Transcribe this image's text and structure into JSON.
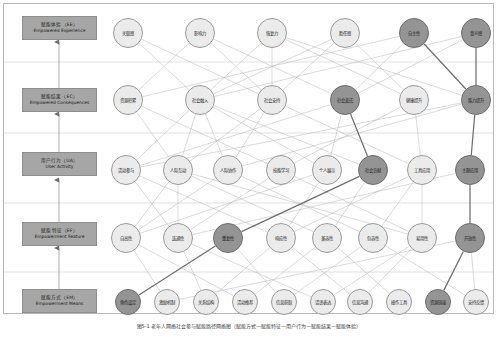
{
  "figure": {
    "caption": "图5-1 老年人网络社会参与赋能路径网络图（赋能方式—赋能特征—用户行为—赋能结果—赋能体验）",
    "width": 498,
    "height": 337,
    "colors": {
      "node_fill": "#ebebeb",
      "node_stroke": "#9a9a9a",
      "node_highlight_fill": "#949494",
      "node_highlight_stroke": "#6d6d6d",
      "layer_box_fill": "#a6a6a6",
      "edge": "#b5b5b5",
      "edge_highlight": "#6f6f6f",
      "frame": "#b9b9b9"
    }
  },
  "layers": [
    {
      "id": "EE",
      "cn": "赋能体验（EE）",
      "en": "Empowered Experience",
      "box": {
        "x": 22,
        "y": 16,
        "w": 75,
        "h": 24
      },
      "row_y": 33,
      "divider_y": 62,
      "nodes": [
        {
          "label": "关联感",
          "cx": 128,
          "cy": 33,
          "r": 15,
          "highlight": false
        },
        {
          "label": "影响力",
          "cx": 200,
          "cy": 33,
          "r": 15,
          "highlight": false
        },
        {
          "label": "恢复力",
          "cx": 272,
          "cy": 33,
          "r": 15,
          "highlight": false
        },
        {
          "label": "胜任感",
          "cx": 345,
          "cy": 33,
          "r": 15,
          "highlight": false
        },
        {
          "label": "自主性",
          "cx": 414,
          "cy": 33,
          "r": 15,
          "highlight": true
        },
        {
          "label": "意义感",
          "cx": 476,
          "cy": 33,
          "r": 15,
          "highlight": true
        }
      ]
    },
    {
      "id": "EC",
      "cn": "赋能结果（EC）",
      "en": "Empowered Consequences",
      "box": {
        "x": 22,
        "y": 88,
        "w": 75,
        "h": 24
      },
      "row_y": 100,
      "divider_y": 133,
      "nodes": [
        {
          "label": "资源积累",
          "cx": 128,
          "cy": 100,
          "r": 15,
          "highlight": false
        },
        {
          "label": "社会融入",
          "cx": 200,
          "cy": 100,
          "r": 15,
          "highlight": false
        },
        {
          "label": "社会支持",
          "cx": 272,
          "cy": 100,
          "r": 15,
          "highlight": false
        },
        {
          "label": "社会变迁",
          "cx": 345,
          "cy": 100,
          "r": 15,
          "highlight": true
        },
        {
          "label": "健康提升",
          "cx": 414,
          "cy": 100,
          "r": 15,
          "highlight": false
        },
        {
          "label": "能力提升",
          "cx": 476,
          "cy": 100,
          "r": 15,
          "highlight": true
        }
      ]
    },
    {
      "id": "UA",
      "cn": "用户行为（UA）",
      "en": "User Activity",
      "box": {
        "x": 22,
        "y": 152,
        "w": 75,
        "h": 24
      },
      "row_y": 170,
      "divider_y": 203,
      "nodes": [
        {
          "label": "活动参与",
          "cx": 126,
          "cy": 170,
          "r": 15,
          "highlight": false
        },
        {
          "label": "人际互动",
          "cx": 178,
          "cy": 170,
          "r": 15,
          "highlight": false
        },
        {
          "label": "人际协作",
          "cx": 228,
          "cy": 170,
          "r": 15,
          "highlight": false
        },
        {
          "label": "技能学习",
          "cx": 281,
          "cy": 170,
          "r": 15,
          "highlight": false
        },
        {
          "label": "个人展示",
          "cx": 327,
          "cy": 170,
          "r": 15,
          "highlight": false
        },
        {
          "label": "社会贡献",
          "cx": 373,
          "cy": 170,
          "r": 15,
          "highlight": true
        },
        {
          "label": "工具应用",
          "cx": 422,
          "cy": 170,
          "r": 15,
          "highlight": false
        },
        {
          "label": "主题应用",
          "cx": 470,
          "cy": 170,
          "r": 15,
          "highlight": true
        }
      ]
    },
    {
      "id": "EF",
      "cn": "赋能特征（EF）",
      "en": "Empowerment Feature",
      "box": {
        "x": 22,
        "y": 222,
        "w": 75,
        "h": 24
      },
      "row_y": 238,
      "divider_y": 272,
      "nodes": [
        {
          "label": "自高性",
          "cx": 126,
          "cy": 238,
          "r": 15,
          "highlight": false
        },
        {
          "label": "连通性",
          "cx": 178,
          "cy": 238,
          "r": 15,
          "highlight": false
        },
        {
          "label": "重复性",
          "cx": 228,
          "cy": 238,
          "r": 15,
          "highlight": true
        },
        {
          "label": "响应性",
          "cx": 281,
          "cy": 238,
          "r": 15,
          "highlight": false
        },
        {
          "label": "兼容性",
          "cx": 327,
          "cy": 238,
          "r": 15,
          "highlight": false
        },
        {
          "label": "包容性",
          "cx": 373,
          "cy": 238,
          "r": 15,
          "highlight": false
        },
        {
          "label": "易用性",
          "cx": 422,
          "cy": 238,
          "r": 15,
          "highlight": false
        },
        {
          "label": "开放性",
          "cx": 470,
          "cy": 238,
          "r": 15,
          "highlight": true
        }
      ]
    },
    {
      "id": "EM",
      "cn": "赋能方式（EM）",
      "en": "Empowerment Means",
      "box": {
        "x": 22,
        "y": 289,
        "w": 75,
        "h": 24
      },
      "row_y": 302,
      "divider_y": null,
      "nodes": [
        {
          "label": "角色设定",
          "cx": 128,
          "cy": 302,
          "r": 13,
          "highlight": true
        },
        {
          "label": "激励机制",
          "cx": 167,
          "cy": 302,
          "r": 13,
          "highlight": false
        },
        {
          "label": "关系结构",
          "cx": 206,
          "cy": 302,
          "r": 13,
          "highlight": false
        },
        {
          "label": "活动推荐",
          "cx": 245,
          "cy": 302,
          "r": 13,
          "highlight": false
        },
        {
          "label": "信息获取",
          "cx": 284,
          "cy": 302,
          "r": 13,
          "highlight": false
        },
        {
          "label": "话语表达",
          "cx": 323,
          "cy": 302,
          "r": 13,
          "highlight": false
        },
        {
          "label": "信息沟通",
          "cx": 360,
          "cy": 302,
          "r": 13,
          "highlight": false
        },
        {
          "label": "操作工具",
          "cx": 399,
          "cy": 302,
          "r": 13,
          "highlight": false
        },
        {
          "label": "资源链接",
          "cx": 438,
          "cy": 302,
          "r": 13,
          "highlight": true
        },
        {
          "label": "支持反馈",
          "cx": 476,
          "cy": 302,
          "r": 13,
          "highlight": false
        }
      ]
    }
  ],
  "layer_arrows": [
    {
      "from": "EM",
      "to": "EF",
      "x": 59,
      "y1": 289,
      "y2": 248
    },
    {
      "from": "EF",
      "to": "UA",
      "x": 59,
      "y1": 222,
      "y2": 180
    },
    {
      "from": "UA",
      "to": "EC",
      "x": 59,
      "y1": 152,
      "y2": 114
    },
    {
      "from": "EC",
      "to": "EE",
      "x": 59,
      "y1": 88,
      "y2": 42
    }
  ],
  "edges": [
    {
      "from": [
        128,
        33
      ],
      "to": [
        200,
        100
      ],
      "hi": false
    },
    {
      "from": [
        128,
        33
      ],
      "to": [
        272,
        100
      ],
      "hi": false
    },
    {
      "from": [
        200,
        33
      ],
      "to": [
        128,
        100
      ],
      "hi": false
    },
    {
      "from": [
        200,
        33
      ],
      "to": [
        272,
        100
      ],
      "hi": false
    },
    {
      "from": [
        200,
        33
      ],
      "to": [
        345,
        100
      ],
      "hi": false
    },
    {
      "from": [
        272,
        33
      ],
      "to": [
        200,
        100
      ],
      "hi": false
    },
    {
      "from": [
        272,
        33
      ],
      "to": [
        272,
        100
      ],
      "hi": false
    },
    {
      "from": [
        272,
        33
      ],
      "to": [
        414,
        100
      ],
      "hi": false
    },
    {
      "from": [
        272,
        33
      ],
      "to": [
        476,
        100
      ],
      "hi": false
    },
    {
      "from": [
        345,
        33
      ],
      "to": [
        200,
        100
      ],
      "hi": false
    },
    {
      "from": [
        345,
        33
      ],
      "to": [
        272,
        100
      ],
      "hi": false
    },
    {
      "from": [
        345,
        33
      ],
      "to": [
        414,
        100
      ],
      "hi": false
    },
    {
      "from": [
        414,
        33
      ],
      "to": [
        128,
        100
      ],
      "hi": false
    },
    {
      "from": [
        414,
        33
      ],
      "to": [
        345,
        100
      ],
      "hi": false
    },
    {
      "from": [
        414,
        33
      ],
      "to": [
        476,
        100
      ],
      "hi": true
    },
    {
      "from": [
        476,
        33
      ],
      "to": [
        200,
        100
      ],
      "hi": false
    },
    {
      "from": [
        476,
        33
      ],
      "to": [
        476,
        100
      ],
      "hi": true
    },
    {
      "from": [
        476,
        33
      ],
      "to": [
        345,
        100
      ],
      "hi": false
    },
    {
      "from": [
        128,
        100
      ],
      "to": [
        178,
        170
      ],
      "hi": false
    },
    {
      "from": [
        128,
        100
      ],
      "to": [
        281,
        170
      ],
      "hi": false
    },
    {
      "from": [
        200,
        100
      ],
      "to": [
        126,
        170
      ],
      "hi": false
    },
    {
      "from": [
        200,
        100
      ],
      "to": [
        178,
        170
      ],
      "hi": false
    },
    {
      "from": [
        200,
        100
      ],
      "to": [
        228,
        170
      ],
      "hi": false
    },
    {
      "from": [
        200,
        100
      ],
      "to": [
        327,
        170
      ],
      "hi": false
    },
    {
      "from": [
        200,
        100
      ],
      "to": [
        373,
        170
      ],
      "hi": false
    },
    {
      "from": [
        272,
        100
      ],
      "to": [
        178,
        170
      ],
      "hi": false
    },
    {
      "from": [
        272,
        100
      ],
      "to": [
        228,
        170
      ],
      "hi": false
    },
    {
      "from": [
        272,
        100
      ],
      "to": [
        422,
        170
      ],
      "hi": false
    },
    {
      "from": [
        345,
        100
      ],
      "to": [
        327,
        170
      ],
      "hi": false
    },
    {
      "from": [
        345,
        100
      ],
      "to": [
        373,
        170
      ],
      "hi": true
    },
    {
      "from": [
        345,
        100
      ],
      "to": [
        126,
        170
      ],
      "hi": false
    },
    {
      "from": [
        414,
        100
      ],
      "to": [
        281,
        170
      ],
      "hi": false
    },
    {
      "from": [
        414,
        100
      ],
      "to": [
        422,
        170
      ],
      "hi": false
    },
    {
      "from": [
        476,
        100
      ],
      "to": [
        470,
        170
      ],
      "hi": true
    },
    {
      "from": [
        476,
        100
      ],
      "to": [
        228,
        170
      ],
      "hi": false
    },
    {
      "from": [
        476,
        100
      ],
      "to": [
        126,
        170
      ],
      "hi": false
    },
    {
      "from": [
        126,
        170
      ],
      "to": [
        178,
        238
      ],
      "hi": false
    },
    {
      "from": [
        126,
        170
      ],
      "to": [
        281,
        238
      ],
      "hi": false
    },
    {
      "from": [
        178,
        170
      ],
      "to": [
        126,
        238
      ],
      "hi": false
    },
    {
      "from": [
        178,
        170
      ],
      "to": [
        178,
        238
      ],
      "hi": false
    },
    {
      "from": [
        178,
        170
      ],
      "to": [
        327,
        238
      ],
      "hi": false
    },
    {
      "from": [
        178,
        170
      ],
      "to": [
        422,
        238
      ],
      "hi": false
    },
    {
      "from": [
        228,
        170
      ],
      "to": [
        126,
        238
      ],
      "hi": false
    },
    {
      "from": [
        228,
        170
      ],
      "to": [
        373,
        238
      ],
      "hi": false
    },
    {
      "from": [
        281,
        170
      ],
      "to": [
        178,
        238
      ],
      "hi": false
    },
    {
      "from": [
        281,
        170
      ],
      "to": [
        422,
        238
      ],
      "hi": false
    },
    {
      "from": [
        327,
        170
      ],
      "to": [
        281,
        238
      ],
      "hi": false
    },
    {
      "from": [
        327,
        170
      ],
      "to": [
        126,
        238
      ],
      "hi": false
    },
    {
      "from": [
        373,
        170
      ],
      "to": [
        228,
        238
      ],
      "hi": true
    },
    {
      "from": [
        373,
        170
      ],
      "to": [
        327,
        238
      ],
      "hi": false
    },
    {
      "from": [
        422,
        170
      ],
      "to": [
        373,
        238
      ],
      "hi": false
    },
    {
      "from": [
        422,
        170
      ],
      "to": [
        422,
        238
      ],
      "hi": false
    },
    {
      "from": [
        422,
        170
      ],
      "to": [
        281,
        238
      ],
      "hi": false
    },
    {
      "from": [
        470,
        170
      ],
      "to": [
        470,
        238
      ],
      "hi": true
    },
    {
      "from": [
        470,
        170
      ],
      "to": [
        178,
        238
      ],
      "hi": false
    },
    {
      "from": [
        126,
        238
      ],
      "to": [
        167,
        302
      ],
      "hi": false
    },
    {
      "from": [
        126,
        238
      ],
      "to": [
        245,
        302
      ],
      "hi": false
    },
    {
      "from": [
        178,
        238
      ],
      "to": [
        206,
        302
      ],
      "hi": false
    },
    {
      "from": [
        178,
        238
      ],
      "to": [
        323,
        302
      ],
      "hi": false
    },
    {
      "from": [
        228,
        238
      ],
      "to": [
        128,
        302
      ],
      "hi": true
    },
    {
      "from": [
        228,
        238
      ],
      "to": [
        284,
        302
      ],
      "hi": false
    },
    {
      "from": [
        281,
        238
      ],
      "to": [
        206,
        302
      ],
      "hi": false
    },
    {
      "from": [
        281,
        238
      ],
      "to": [
        360,
        302
      ],
      "hi": false
    },
    {
      "from": [
        327,
        238
      ],
      "to": [
        245,
        302
      ],
      "hi": false
    },
    {
      "from": [
        327,
        238
      ],
      "to": [
        399,
        302
      ],
      "hi": false
    },
    {
      "from": [
        373,
        238
      ],
      "to": [
        284,
        302
      ],
      "hi": false
    },
    {
      "from": [
        373,
        238
      ],
      "to": [
        476,
        302
      ],
      "hi": false
    },
    {
      "from": [
        422,
        238
      ],
      "to": [
        323,
        302
      ],
      "hi": false
    },
    {
      "from": [
        422,
        238
      ],
      "to": [
        360,
        302
      ],
      "hi": false
    },
    {
      "from": [
        470,
        238
      ],
      "to": [
        438,
        302
      ],
      "hi": true
    },
    {
      "from": [
        470,
        238
      ],
      "to": [
        476,
        302
      ],
      "hi": false
    },
    {
      "from": [
        470,
        238
      ],
      "to": [
        167,
        302
      ],
      "hi": false
    }
  ]
}
